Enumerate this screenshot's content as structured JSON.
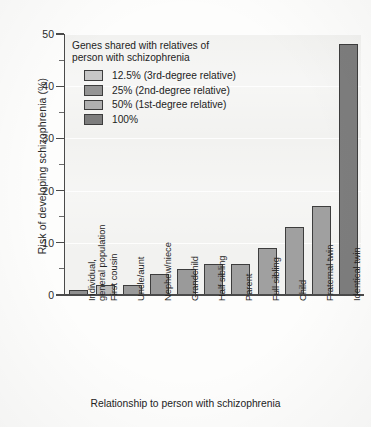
{
  "chart_data": {
    "type": "bar",
    "title": "",
    "xlabel": "Relationship to person with schizophrenia",
    "ylabel": "Risk of developing schizophrenia (%)",
    "ylim": [
      0,
      50
    ],
    "ytick_labels": [
      "0",
      "10",
      "20",
      "30",
      "40",
      "50"
    ],
    "ytick_values": [
      0,
      10,
      20,
      30,
      40,
      50
    ],
    "yminor_values": [
      5,
      15,
      25,
      35,
      45
    ],
    "grid": true,
    "legend_position": "upper-left-inside",
    "categories": [
      "Individual, general population",
      "First cousin",
      "Uncle/aunt",
      "Nephew/niece",
      "Grandchild",
      "Half sibling",
      "Parent",
      "Full sibling",
      "Child",
      "Fraternal twin",
      "Identical twin"
    ],
    "category_lines": [
      [
        "Individual,",
        "general population"
      ],
      [
        "First cousin"
      ],
      [
        "Uncle/aunt"
      ],
      [
        "Nephew/niece"
      ],
      [
        "Grandchild"
      ],
      [
        "Half sibling"
      ],
      [
        "Parent"
      ],
      [
        "Full sibling"
      ],
      [
        "Child"
      ],
      [
        "Fraternal twin"
      ],
      [
        "Identical twin"
      ]
    ],
    "values": [
      1,
      2,
      2,
      4,
      5,
      6,
      6,
      9,
      13,
      17,
      48
    ],
    "groups": [
      "12.5% (3rd-degree relative)",
      "12.5% (3rd-degree relative)",
      "25% (2nd-degree relative)",
      "25% (2nd-degree relative)",
      "25% (2nd-degree relative)",
      "25% (2nd-degree relative)",
      "50% (1st-degree relative)",
      "50% (1st-degree relative)",
      "50% (1st-degree relative)",
      "50% (1st-degree relative)",
      "100%"
    ],
    "bar_colors": [
      "#8f8f8f",
      "#b9b9b9",
      "#9a9a9a",
      "#9a9a9a",
      "#9a9a9a",
      "#9a9a9a",
      "#a0a0a0",
      "#a0a0a0",
      "#a0a0a0",
      "#a0a0a0",
      "#7d7d7d"
    ]
  },
  "legend": {
    "title_line1": "Genes shared with relatives of",
    "title_line2": "person with schizophrenia",
    "entries": [
      {
        "label": "12.5% (3rd-degree relative)",
        "color": "#c6c6c6"
      },
      {
        "label": "25% (2nd-degree relative)",
        "color": "#949494"
      },
      {
        "label": "50% (1st-degree relative)",
        "color": "#b0b0b0"
      },
      {
        "label": "100%",
        "color": "#7d7d7d"
      }
    ]
  },
  "colors": {
    "axis": "#4a4a4a",
    "bar_border": "#3d3d3d",
    "plot_background": "#f2f2f0",
    "page_background": "#fdfdfc",
    "text": "#232323"
  }
}
